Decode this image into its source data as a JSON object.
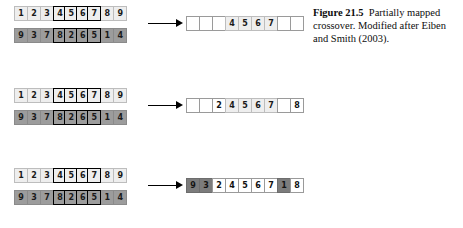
{
  "figure": {
    "caption_label": "Figure 21.5",
    "caption_text": "Partially mapped crossover. Modified after Eiben and Smith (2003)."
  },
  "diagram": {
    "type": "genetic-algorithm-crossover",
    "arrow_glyph": "→",
    "colors": {
      "parent1_cell": "#eeeeee",
      "parent2_cell": "#9c9c9c",
      "offspring_filled": "#ffffff",
      "offspring_inherited": "#f0f0f0",
      "offspring_dark": "#7c7c7c",
      "segment_border": "#000000",
      "arrow": "#000000",
      "page_background": "#ffffff"
    },
    "segment_start_index": 3,
    "segment_end_index": 6,
    "stages": [
      {
        "name": "stage-1",
        "parent1": {
          "name": "parent-1",
          "tone": "light",
          "values": [
            "1",
            "2",
            "3",
            "4",
            "5",
            "6",
            "7",
            "8",
            "9"
          ],
          "selected": [
            false,
            false,
            false,
            true,
            true,
            true,
            true,
            false,
            false
          ]
        },
        "parent2": {
          "name": "parent-2",
          "tone": "gray",
          "values": [
            "9",
            "3",
            "7",
            "8",
            "2",
            "6",
            "5",
            "1",
            "4"
          ],
          "selected": [
            false,
            false,
            false,
            true,
            true,
            true,
            true,
            false,
            false
          ]
        },
        "offspring": {
          "name": "offspring-1",
          "values": [
            "",
            "",
            "",
            "4",
            "5",
            "6",
            "7",
            "",
            ""
          ],
          "tones": [
            "empty",
            "empty",
            "empty",
            "light",
            "light",
            "light",
            "light",
            "empty",
            "empty"
          ]
        }
      },
      {
        "name": "stage-2",
        "parent1": {
          "name": "parent-1",
          "tone": "light",
          "values": [
            "1",
            "2",
            "3",
            "4",
            "5",
            "6",
            "7",
            "8",
            "9"
          ],
          "selected": [
            false,
            false,
            false,
            true,
            true,
            true,
            true,
            false,
            false
          ]
        },
        "parent2": {
          "name": "parent-2",
          "tone": "gray",
          "values": [
            "9",
            "3",
            "7",
            "8",
            "2",
            "6",
            "5",
            "1",
            "4"
          ],
          "selected": [
            false,
            false,
            false,
            true,
            true,
            true,
            true,
            false,
            false
          ]
        },
        "offspring": {
          "name": "offspring-2",
          "values": [
            "",
            "",
            "2",
            "4",
            "5",
            "6",
            "7",
            "",
            "8"
          ],
          "tones": [
            "empty",
            "empty",
            "white",
            "light",
            "light",
            "light",
            "light",
            "empty",
            "white"
          ]
        }
      },
      {
        "name": "stage-3",
        "parent1": {
          "name": "parent-1",
          "tone": "light",
          "values": [
            "1",
            "2",
            "3",
            "4",
            "5",
            "6",
            "7",
            "8",
            "9"
          ],
          "selected": [
            false,
            false,
            false,
            true,
            true,
            true,
            true,
            false,
            false
          ]
        },
        "parent2": {
          "name": "parent-2",
          "tone": "gray",
          "values": [
            "9",
            "3",
            "7",
            "8",
            "2",
            "6",
            "5",
            "1",
            "4"
          ],
          "selected": [
            false,
            false,
            false,
            true,
            true,
            true,
            true,
            false,
            false
          ]
        },
        "offspring": {
          "name": "offspring-3",
          "values": [
            "9",
            "3",
            "2",
            "4",
            "5",
            "6",
            "7",
            "1",
            "8"
          ],
          "tones": [
            "dark",
            "dark",
            "white",
            "white",
            "white",
            "white",
            "white",
            "dark",
            "white"
          ]
        }
      }
    ]
  }
}
